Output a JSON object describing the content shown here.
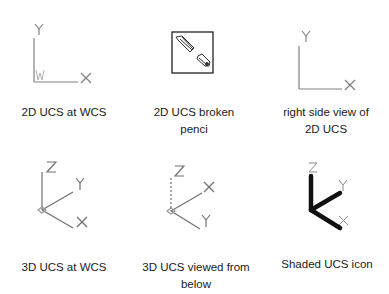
{
  "panels": [
    {
      "id": "2d-ucs-wcs",
      "caption": [
        "2D UCS at WCS"
      ],
      "axes": {
        "y": "Y",
        "x": "X",
        "origin": "W"
      }
    },
    {
      "id": "2d-ucs-broken-pencil",
      "caption": [
        "2D UCS broken",
        "penci"
      ]
    },
    {
      "id": "right-side-view",
      "caption": [
        "right side view of",
        "2D UCS"
      ],
      "axes": {
        "y": "Y",
        "x": "X"
      }
    },
    {
      "id": "3d-ucs-wcs",
      "caption": [
        "3D UCS at WCS"
      ],
      "axes": {
        "z": "Z",
        "y": "Y",
        "x": "X"
      }
    },
    {
      "id": "3d-ucs-below",
      "caption": [
        "3D UCS viewed from",
        "below"
      ],
      "axes": {
        "z": "Z",
        "x": "X",
        "y": "Y"
      }
    },
    {
      "id": "shaded-ucs",
      "caption": [
        "Shaded UCS icon"
      ],
      "axes": {
        "z": "Z",
        "y": "Y",
        "x": "X"
      }
    }
  ],
  "colors": {
    "line": "#7a7a7a",
    "label": "#8a8a8a",
    "shaded": "#111111",
    "text": "#1a1a1a"
  }
}
